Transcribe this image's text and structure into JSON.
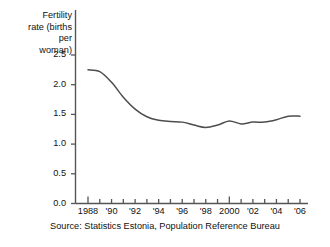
{
  "chart_data": {
    "type": "line",
    "title": "",
    "ylabel": "Fertility rate (births per woman)",
    "xlabel": "",
    "source": "Source:  Statistics Estonia, Population Reference Bureau",
    "grid": false,
    "legend": "none",
    "ylim": [
      0.0,
      2.5
    ],
    "xlim": [
      1988,
      2006
    ],
    "ytick_labels": [
      "0.0",
      "0.5",
      "1.0",
      "1.5",
      "2.0",
      "2.5"
    ],
    "ytick_values": [
      0.0,
      0.5,
      1.0,
      1.5,
      2.0,
      2.5
    ],
    "xtick_values": [
      1988,
      1989,
      1990,
      1991,
      1992,
      1993,
      1994,
      1995,
      1996,
      1997,
      1998,
      1999,
      2000,
      2001,
      2002,
      2003,
      2004,
      2005,
      2006
    ],
    "xtick_labels": [
      "1988",
      "",
      "'90",
      "",
      "'92",
      "",
      "'94",
      "",
      "'96",
      "",
      "'98",
      "",
      "2000",
      "",
      "'02",
      "",
      "'04",
      "",
      "'06"
    ],
    "line_color": "#4d4d4d",
    "series": [
      {
        "name": "Fertility rate",
        "x": [
          1988,
          1989,
          1990,
          1991,
          1992,
          1993,
          1994,
          1995,
          1996,
          1997,
          1998,
          1999,
          2000,
          2001,
          2002,
          2003,
          2004,
          2005,
          2006
        ],
        "values": [
          2.25,
          2.22,
          2.04,
          1.79,
          1.59,
          1.46,
          1.4,
          1.38,
          1.37,
          1.32,
          1.28,
          1.32,
          1.39,
          1.34,
          1.37,
          1.37,
          1.41,
          1.47,
          1.47
        ]
      }
    ]
  },
  "axis": {
    "title_text": "Fertility\nrate (births\nper woman)"
  }
}
